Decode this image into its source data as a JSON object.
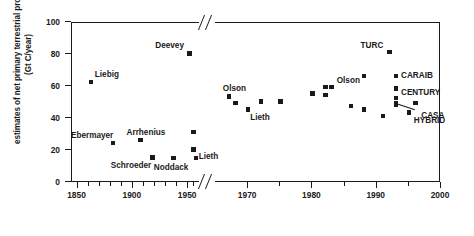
{
  "chart_data": {
    "type": "scatter",
    "title": "",
    "xlabel": "",
    "ylabel": "estimates of net primary terrestrial productivity (Gt C/year)",
    "xlim": [
      1845,
      2000
    ],
    "ylim": [
      0,
      100
    ],
    "grid": false,
    "legend": "none",
    "axis_break": {
      "present": true,
      "between": [
        1958,
        1965
      ],
      "note": "broken x-axis between the pre-1960 segment and the 1965-2000 segment"
    },
    "x_ticks": [
      1850,
      1900,
      1950,
      1970,
      1980,
      1990,
      2000
    ],
    "x_tick_labels": [
      "1850",
      "1900",
      "1950",
      "1970",
      "1980",
      "1990",
      "2000"
    ],
    "y_ticks": [
      0,
      20,
      40,
      60,
      80,
      100
    ],
    "y_tick_labels": [
      "0",
      "20",
      "40",
      "60",
      "80",
      "100"
    ],
    "points": [
      {
        "label": "Liebig",
        "x": 1862,
        "y": 63,
        "label_dx": 4,
        "label_dy": -12
      },
      {
        "label": "Ebermayer",
        "x": 1882,
        "y": 25,
        "label_dx": -42,
        "label_dy": -12
      },
      {
        "label": "Arrhenius",
        "x": 1907,
        "y": 27,
        "label_dx": -14,
        "label_dy": -12
      },
      {
        "label": "Schroeder",
        "x": 1918,
        "y": 16,
        "label_dx": -42,
        "label_dy": 4
      },
      {
        "label": "Noddack",
        "x": 1937,
        "y": 15.5,
        "label_dx": -20,
        "label_dy": 5
      },
      {
        "label": "Deevey",
        "x": 1951,
        "y": 81,
        "label_dx": -34,
        "label_dy": -12
      },
      {
        "label": "",
        "x": 1955,
        "y": 32,
        "label_dx": 0,
        "label_dy": 0
      },
      {
        "label": "Lieth",
        "x": 1955,
        "y": 21,
        "label_dx": 5,
        "label_dy": 3
      },
      {
        "label": "",
        "x": 1957,
        "y": 15.5,
        "label_dx": 0,
        "label_dy": 0
      },
      {
        "label": "Olson",
        "x": 1967,
        "y": 54,
        "label_dx": -6,
        "label_dy": -13
      },
      {
        "label": "",
        "x": 1968,
        "y": 50,
        "label_dx": 0,
        "label_dy": 0
      },
      {
        "label": "Lieth",
        "x": 1970,
        "y": 46,
        "label_dx": 2,
        "label_dy": 4
      },
      {
        "label": "",
        "x": 1972,
        "y": 51,
        "label_dx": 0,
        "label_dy": 0
      },
      {
        "label": "",
        "x": 1975,
        "y": 51,
        "label_dx": 0,
        "label_dy": 0
      },
      {
        "label": "",
        "x": 1980,
        "y": 56,
        "label_dx": 0,
        "label_dy": 0
      },
      {
        "label": "Olson",
        "x": 1983,
        "y": 60,
        "label_dx": 5,
        "label_dy": -11
      },
      {
        "label": "",
        "x": 1982,
        "y": 60,
        "label_dx": 0,
        "label_dy": 0
      },
      {
        "label": "",
        "x": 1982,
        "y": 55,
        "label_dx": 0,
        "label_dy": 0
      },
      {
        "label": "",
        "x": 1986,
        "y": 48,
        "label_dx": 0,
        "label_dy": 0
      },
      {
        "label": "",
        "x": 1988,
        "y": 67,
        "label_dx": 0,
        "label_dy": 0
      },
      {
        "label": "",
        "x": 1988,
        "y": 46,
        "label_dx": 0,
        "label_dy": 0
      },
      {
        "label": "TURC",
        "x": 1992,
        "y": 82,
        "label_dx": -29,
        "label_dy": -11
      },
      {
        "label": "CARAIB",
        "x": 1993,
        "y": 67,
        "label_dx": 5,
        "label_dy": -5
      },
      {
        "label": "CENTURY",
        "x": 1993,
        "y": 59,
        "label_dx": 5,
        "label_dy": -1
      },
      {
        "label": "",
        "x": 1993,
        "y": 53,
        "label_dx": 0,
        "label_dy": 0
      },
      {
        "label": "",
        "x": 1993,
        "y": 50,
        "label_dx": 0,
        "label_dy": 0
      },
      {
        "label": "",
        "x": 1993,
        "y": 49,
        "label_dx": 0,
        "label_dy": 0
      },
      {
        "label": "CASA",
        "x": 1996,
        "y": 50,
        "label_dx": 6,
        "label_dy": 8
      },
      {
        "label": "HYBRID",
        "x": 1995,
        "y": 44,
        "label_dx": 5,
        "label_dy": 3
      },
      {
        "label": "",
        "x": 1991,
        "y": 42,
        "label_dx": 0,
        "label_dy": 0
      }
    ],
    "leaders": [
      {
        "from_x": 1993,
        "from_y": 50,
        "to_x": 1996,
        "to_y": 46
      }
    ],
    "colors": {
      "marker": "#1a1a1a",
      "axis": "#1a1a1a",
      "background": "#ffffff"
    }
  }
}
